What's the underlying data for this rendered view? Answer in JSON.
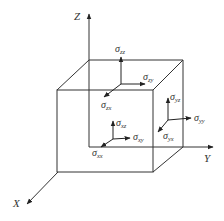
{
  "figure": {
    "axes": {
      "z": {
        "label": "Z"
      },
      "y": {
        "label": "Y"
      },
      "x": {
        "label": "X"
      }
    },
    "faces": {
      "top": {
        "normal": {
          "symbol": "σ",
          "sub": "zz"
        },
        "shear_y": {
          "symbol": "σ",
          "sub": "zy"
        },
        "shear_x": {
          "symbol": "σ",
          "sub": "zx"
        }
      },
      "right": {
        "normal": {
          "symbol": "σ",
          "sub": "yy"
        },
        "shear_z": {
          "symbol": "σ",
          "sub": "yz"
        },
        "shear_x": {
          "symbol": "σ",
          "sub": "yx"
        }
      },
      "front": {
        "normal": {
          "symbol": "σ",
          "sub": "xx"
        },
        "shear_z": {
          "symbol": "σ",
          "sub": "xz"
        },
        "shear_y": {
          "symbol": "σ",
          "sub": "xy"
        }
      }
    },
    "colors": {
      "line": "#333333",
      "background": "#ffffff"
    }
  }
}
